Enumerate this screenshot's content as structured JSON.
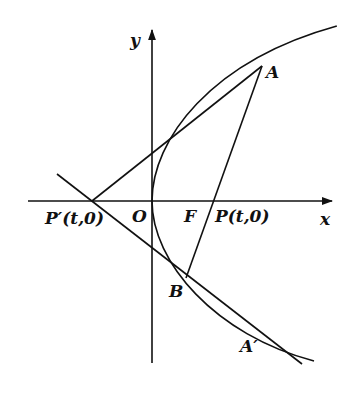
{
  "figure": {
    "type": "parabola-tangent-diagram",
    "axes": {
      "x_label": "x",
      "y_label": "y",
      "origin_label": "O"
    },
    "points": {
      "A": "A",
      "A_prime": "A′",
      "B": "B",
      "F": "F",
      "P": "P(t,0)",
      "P_prime": "P′(t,0)"
    },
    "colors": {
      "stroke": "#111111",
      "background": "#ffffff"
    }
  }
}
